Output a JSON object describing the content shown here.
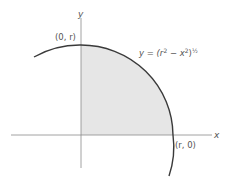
{
  "diagram": {
    "axes": {
      "x_label": "x",
      "y_label": "y"
    },
    "points": {
      "top": "(0, r)",
      "right": "(r, 0)"
    },
    "curve_label": {
      "prefix": "y = (r",
      "sup1": "2",
      "mid": " − x",
      "sup2": "2",
      "close": ")",
      "exp": "½"
    },
    "colors": {
      "shade": "#e6e6e6",
      "curve": "#3a3a3a",
      "axis": "#8a8a8a",
      "text": "#555555"
    }
  }
}
